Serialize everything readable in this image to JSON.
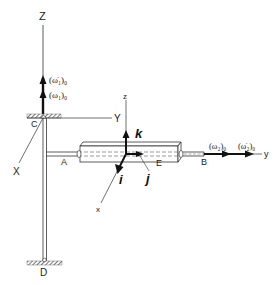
{
  "diagram": {
    "type": "rigid-body-dynamics-figure",
    "colors": {
      "line": "#333333",
      "thick_arrow": "#111111",
      "hatch": "#555555",
      "background": "#ffffff"
    },
    "labels": {
      "Z_axis": "Z",
      "Y_axis": "Y",
      "X_axis": "X",
      "point_C": "C",
      "point_A": "A",
      "point_B": "B",
      "point_D": "D",
      "point_E": "E",
      "z_local": "z",
      "y_local": "y",
      "x_local": "x",
      "unit_i": "i",
      "unit_j": "j",
      "unit_k": "k"
    },
    "vectors": {
      "omega1_dot": "(ω̇₁)₀",
      "omega1": "(ω₁)₀",
      "omega2": "(ω₂)₀",
      "omega2_dot": "(ω̇₂)₀"
    }
  }
}
